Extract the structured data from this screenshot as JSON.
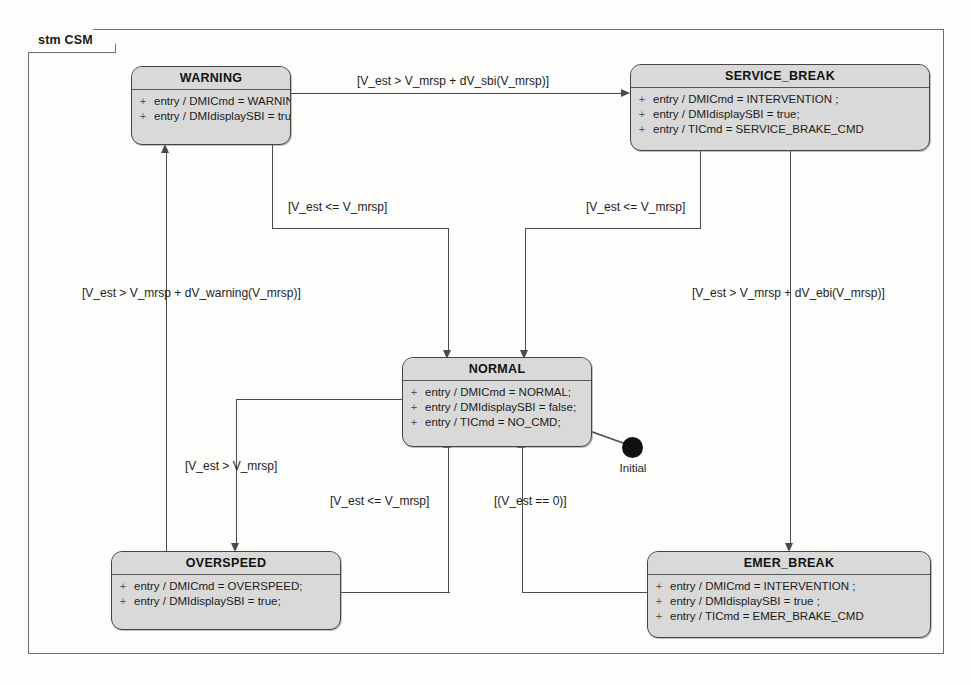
{
  "frame": {
    "label": "stm CSM"
  },
  "states": [
    {
      "id": "warning",
      "name": "WARNING",
      "entries": [
        "entry / DMICmd = WARNING;",
        "entry / DMIdisplaySBI = true;"
      ]
    },
    {
      "id": "service_break",
      "name": "SERVICE_BREAK",
      "entries": [
        "entry / DMICmd = INTERVENTION ;",
        "entry / DMIdisplaySBI = true;",
        "entry / TICmd = SERVICE_BRAKE_CMD"
      ]
    },
    {
      "id": "normal",
      "name": "NORMAL",
      "entries": [
        "entry / DMICmd = NORMAL;",
        "entry / DMIdisplaySBI = false;",
        "entry / TICmd = NO_CMD;"
      ]
    },
    {
      "id": "overspeed",
      "name": "OVERSPEED",
      "entries": [
        "entry / DMICmd = OVERSPEED;",
        "entry / DMIdisplaySBI = true;"
      ]
    },
    {
      "id": "emer_break",
      "name": "EMER_BREAK",
      "entries": [
        "entry / DMICmd = INTERVENTION ;",
        "entry / DMIdisplaySBI = true ;",
        "entry / TICmd = EMER_BRAKE_CMD"
      ]
    }
  ],
  "initial": {
    "label": "Initial",
    "target": "NORMAL"
  },
  "transitions": [
    {
      "id": "warning-to-service-break",
      "source": "WARNING",
      "target": "SERVICE_BREAK",
      "guard": "[V_est > V_mrsp + dV_sbi(V_mrsp)]"
    },
    {
      "id": "warning-to-normal",
      "source": "WARNING",
      "target": "NORMAL",
      "guard": "[V_est <= V_mrsp]"
    },
    {
      "id": "service-break-to-normal",
      "source": "SERVICE_BREAK",
      "target": "NORMAL",
      "guard": "[V_est <= V_mrsp]"
    },
    {
      "id": "overspeed-to-warning",
      "source": "OVERSPEED",
      "target": "WARNING",
      "guard": "[V_est > V_mrsp + dV_warning(V_mrsp)]"
    },
    {
      "id": "service-break-to-emer-break",
      "source": "SERVICE_BREAK",
      "target": "EMER_BREAK",
      "guard": "[V_est > V_mrsp + dV_ebi(V_mrsp)]"
    },
    {
      "id": "normal-to-overspeed",
      "source": "NORMAL",
      "target": "OVERSPEED",
      "guard": "[V_est > V_mrsp]"
    },
    {
      "id": "overspeed-to-normal",
      "source": "OVERSPEED",
      "target": "NORMAL",
      "guard": "[V_est <= V_mrsp]"
    },
    {
      "id": "emer-break-to-normal",
      "source": "EMER_BREAK",
      "target": "NORMAL",
      "guard": "[(V_est == 0)]"
    }
  ],
  "colors": {
    "state_fill": "#d9d9d9",
    "state_border": "#444444",
    "line": "#4a4a4a",
    "frame_border": "#6e6e6e"
  }
}
